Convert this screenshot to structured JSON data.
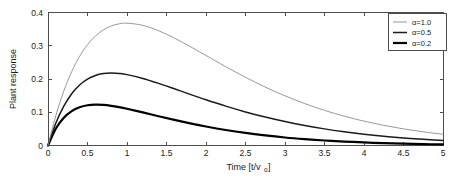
{
  "chart_data": {
    "type": "line",
    "title": "",
    "xlabel": "Time [t/v_o]",
    "xlabel_main": "Time [t/v",
    "xlabel_sub": "o",
    "xlabel_tail": "]",
    "ylabel": "Plant response",
    "xlim": [
      0,
      5
    ],
    "ylim": [
      0,
      0.4
    ],
    "grid": false,
    "legend_position": "top-right",
    "xticks": [
      "0",
      "0.5",
      "1",
      "1.5",
      "2",
      "2.5",
      "3",
      "3.5",
      "4",
      "4.5",
      "5"
    ],
    "xtick_values": [
      0,
      0.5,
      1,
      1.5,
      2,
      2.5,
      3,
      3.5,
      4,
      4.5,
      5
    ],
    "yticks": [
      "0",
      "0.1",
      "0.2",
      "0.3",
      "0.4"
    ],
    "ytick_values": [
      0,
      0.1,
      0.2,
      0.3,
      0.4
    ],
    "x": [
      0,
      0.1,
      0.2,
      0.3,
      0.4,
      0.5,
      0.6,
      0.7,
      0.8,
      0.9,
      1.0,
      1.2,
      1.4,
      1.6,
      1.8,
      2.0,
      2.25,
      2.5,
      2.75,
      3.0,
      3.25,
      3.5,
      3.75,
      4.0,
      4.25,
      4.5,
      4.75,
      5.0
    ],
    "series": [
      {
        "name": "α=1.0",
        "label": "α=1.0",
        "alpha": 1.0,
        "color": "#8c8c8c",
        "width": 0.9,
        "peak_x": 1.0,
        "peak_y": 0.368,
        "values": [
          0,
          0.0905,
          0.1637,
          0.2222,
          0.2681,
          0.3033,
          0.3293,
          0.3476,
          0.3595,
          0.3659,
          0.3679,
          0.3614,
          0.3452,
          0.323,
          0.2975,
          0.2707,
          0.2371,
          0.2052,
          0.1757,
          0.1494,
          0.1261,
          0.1057,
          0.0881,
          0.0733,
          0.0606,
          0.05,
          0.0411,
          0.0337
        ]
      },
      {
        "name": "α=0.5",
        "label": "α=0.5",
        "alpha": 0.5,
        "color": "#1a1a1a",
        "width": 1.5,
        "peak_x": 0.7,
        "peak_y": 0.25,
        "values": [
          0,
          0.0675,
          0.1182,
          0.1556,
          0.182,
          0.1997,
          0.2105,
          0.2162,
          0.2178,
          0.2165,
          0.2131,
          0.2017,
          0.1869,
          0.1705,
          0.1537,
          0.1375,
          0.1184,
          0.101,
          0.0855,
          0.0719,
          0.0602,
          0.05,
          0.0414,
          0.0341,
          0.028,
          0.0229,
          0.0186,
          0.0151
        ]
      },
      {
        "name": "α=0.2",
        "label": "α=0.2",
        "alpha": 0.2,
        "color": "#000000",
        "width": 2.2,
        "peak_x": 0.42,
        "peak_y": 0.135,
        "values": [
          0,
          0.051,
          0.0835,
          0.1036,
          0.1152,
          0.121,
          0.1229,
          0.122,
          0.1193,
          0.1153,
          0.1104,
          0.0995,
          0.0881,
          0.077,
          0.0666,
          0.0571,
          0.0466,
          0.0377,
          0.0303,
          0.0241,
          0.0191,
          0.015,
          0.0118,
          0.0092,
          0.0071,
          0.0055,
          0.0042,
          0.0032
        ]
      }
    ]
  },
  "legend": {
    "entries": [
      {
        "label": "α=1.0"
      },
      {
        "label": "α=0.5"
      },
      {
        "label": "α=0.2"
      }
    ]
  }
}
